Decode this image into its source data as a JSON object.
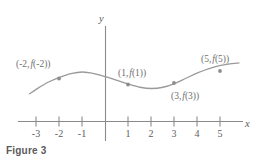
{
  "figure": {
    "caption": "Figure 3",
    "axis_x_label": "x",
    "axis_y_label": "y"
  },
  "chart_data": {
    "type": "line",
    "title": "Figure 3",
    "xlabel": "x",
    "ylabel": "y",
    "grid": false,
    "legend": null,
    "xlim": [
      -3.6,
      5.9
    ],
    "xticks": [
      -3,
      -2,
      -1,
      1,
      2,
      3,
      4,
      5
    ],
    "xtick_labels": [
      "-3",
      "-2",
      "-1",
      "1",
      "2",
      "3",
      "4",
      "5"
    ],
    "marked_points": [
      {
        "x": -2,
        "label": "(-2, f(-2))",
        "label_prefix": "(-2,",
        "label_fn": "f",
        "label_suffix": "(-2))"
      },
      {
        "x": 1,
        "label": "(1, f(1))",
        "label_prefix": "(1,",
        "label_fn": "f",
        "label_suffix": "(1))"
      },
      {
        "x": 3,
        "label": "(3, f(3))",
        "label_prefix": "(3,",
        "label_fn": "f",
        "label_suffix": "(3))"
      },
      {
        "x": 5,
        "label": "(5, f(5))",
        "label_prefix": "(5,",
        "label_fn": "f",
        "label_suffix": "(5))"
      }
    ],
    "curve_description": "Smooth wave: rises to a local maximum near x=-1, falls to a local minimum near x=2, then rises again through x=5",
    "series": [
      {
        "name": "f",
        "x": [
          -3.3,
          -3.0,
          -2.5,
          -2.0,
          -1.5,
          -1.0,
          -0.5,
          0.0,
          0.5,
          1.0,
          1.5,
          2.0,
          2.5,
          3.0,
          3.5,
          4.0,
          4.5,
          5.0,
          5.5,
          5.8
        ],
        "y": [
          1.25,
          1.4,
          1.62,
          1.78,
          1.9,
          1.95,
          1.9,
          1.8,
          1.68,
          1.56,
          1.46,
          1.42,
          1.46,
          1.58,
          1.75,
          1.92,
          2.06,
          2.16,
          2.22,
          2.24
        ]
      }
    ],
    "colors": {
      "curve": "#9a9a9a",
      "point": "#9a9a9a",
      "axis": "#7a7a7a",
      "label_text": "#6f6f6f",
      "caption_text": "#5a5a5a",
      "background": "#ffffff"
    }
  }
}
